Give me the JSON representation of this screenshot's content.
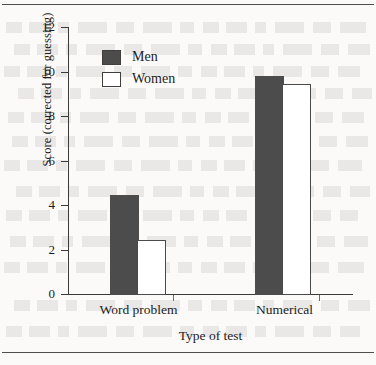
{
  "figure": {
    "background_color": "#fbfaf8",
    "ink_color": "#1c1c1c"
  },
  "chart_data": {
    "type": "bar",
    "title": "",
    "subtitle": "",
    "xlabel": "Type of test",
    "ylabel": "Score (corrected for guessing)",
    "categories": [
      "Word problem",
      "Numerical"
    ],
    "series": [
      {
        "name": "Men",
        "values": [
          4.4,
          9.75
        ],
        "color": "#4c4c4c",
        "fill": "solid"
      },
      {
        "name": "Women",
        "values": [
          2.4,
          9.4
        ],
        "color": "#ffffff",
        "edge_color": "#4a4a4a",
        "fill": "open"
      }
    ],
    "ylim": [
      0,
      12
    ],
    "yticks": [
      0,
      2,
      4,
      6,
      8,
      10,
      12
    ],
    "ytick_labels": [
      "0",
      "2",
      "4",
      "6",
      "8",
      "10",
      "12"
    ],
    "grid": false,
    "legend_position": "upper left",
    "legend_entries": [
      "Men",
      "Women"
    ]
  },
  "axis": {
    "y_title": "Score (corrected for guessing)",
    "x_title": "Type of test",
    "ticks": [
      {
        "value": 12,
        "label": "12"
      },
      {
        "value": 10,
        "label": "10"
      },
      {
        "value": 8,
        "label": "8"
      },
      {
        "value": 6,
        "label": "6"
      },
      {
        "value": 4,
        "label": "4"
      },
      {
        "value": 2,
        "label": "2"
      },
      {
        "value": 0,
        "label": "0"
      }
    ]
  },
  "legend": {
    "items": [
      {
        "label": "Men",
        "style": "filled"
      },
      {
        "label": "Women",
        "style": "open"
      }
    ]
  },
  "categories": [
    {
      "label": "Word problem"
    },
    {
      "label": "Numerical"
    }
  ]
}
